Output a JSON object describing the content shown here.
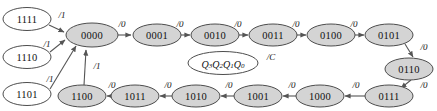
{
  "diagram": {
    "width": 437,
    "height": 111,
    "colors": {
      "state_fill": "#d4d4d4",
      "state_open_fill": "#ffffff",
      "stroke": "#4d4d4d",
      "edge": "#555555",
      "text": "#111111",
      "background": "#ffffff"
    },
    "legend": {
      "state_encoding": "Q3Q2Q1Q0",
      "q3": "Q",
      "q3_sub": "3",
      "q2": "Q",
      "q2_sub": "2",
      "q1": "Q",
      "q1_sub": "1",
      "q0": "Q",
      "q0_sub": "0",
      "output_label": "/C"
    },
    "states": [
      {
        "id": "s1111",
        "label": "1111",
        "cx": 27,
        "cy": 19,
        "rx": 24,
        "ry": 11.5,
        "filled": false
      },
      {
        "id": "s1110",
        "label": "1110",
        "cx": 27,
        "cy": 57,
        "rx": 24,
        "ry": 11.5,
        "filled": false
      },
      {
        "id": "s1101",
        "label": "1101",
        "cx": 27,
        "cy": 94,
        "rx": 24,
        "ry": 11.5,
        "filled": false
      },
      {
        "id": "s0000",
        "label": "0000",
        "cx": 92,
        "cy": 35,
        "rx": 26,
        "ry": 12,
        "filled": true
      },
      {
        "id": "s0001",
        "label": "0001",
        "cx": 157,
        "cy": 35,
        "rx": 24,
        "ry": 11,
        "filled": true
      },
      {
        "id": "s0010",
        "label": "0010",
        "cx": 215,
        "cy": 35,
        "rx": 24,
        "ry": 11,
        "filled": true
      },
      {
        "id": "s0011",
        "label": "0011",
        "cx": 273,
        "cy": 35,
        "rx": 24,
        "ry": 11,
        "filled": true
      },
      {
        "id": "s0100",
        "label": "0100",
        "cx": 331,
        "cy": 35,
        "rx": 24,
        "ry": 11,
        "filled": true
      },
      {
        "id": "s0101",
        "label": "0101",
        "cx": 389,
        "cy": 35,
        "rx": 24,
        "ry": 11,
        "filled": true
      },
      {
        "id": "s0110",
        "label": "0110",
        "cx": 409,
        "cy": 69,
        "rx": 24,
        "ry": 11,
        "filled": true
      },
      {
        "id": "s0111",
        "label": "0111",
        "cx": 389,
        "cy": 96,
        "rx": 24,
        "ry": 11,
        "filled": true
      },
      {
        "id": "s1000",
        "label": "1000",
        "cx": 320,
        "cy": 96,
        "rx": 24,
        "ry": 11,
        "filled": true
      },
      {
        "id": "s1001",
        "label": "1001",
        "cx": 258,
        "cy": 96,
        "rx": 24,
        "ry": 11,
        "filled": true
      },
      {
        "id": "s1010",
        "label": "1010",
        "cx": 196,
        "cy": 96,
        "rx": 24,
        "ry": 11,
        "filled": true
      },
      {
        "id": "s1011",
        "label": "1011",
        "cx": 135,
        "cy": 96,
        "rx": 24,
        "ry": 11,
        "filled": true
      },
      {
        "id": "s1100",
        "label": "1100",
        "cx": 82,
        "cy": 96,
        "rx": 24,
        "ry": 11,
        "filled": true
      }
    ],
    "transitions": [
      {
        "from": "1111",
        "to": "0000",
        "label": "/1",
        "lx": 62,
        "ly": 15
      },
      {
        "from": "1110",
        "to": "0000",
        "label": "/1",
        "lx": 47,
        "ly": 44
      },
      {
        "from": "1101",
        "to": "0000",
        "label": "/1",
        "lx": 50,
        "ly": 79
      },
      {
        "from": "0000",
        "to": "0001",
        "label": "/0",
        "lx": 114,
        "ly": 25
      },
      {
        "from": "0001",
        "to": "0010",
        "label": "/0",
        "lx": 172,
        "ly": 25
      },
      {
        "from": "0010",
        "to": "0011",
        "label": "/0",
        "lx": 230,
        "ly": 25
      },
      {
        "from": "0011",
        "to": "0100",
        "label": "/0",
        "lx": 288,
        "ly": 25
      },
      {
        "from": "0100",
        "to": "0101",
        "label": "/0",
        "lx": 346,
        "ly": 25
      },
      {
        "from": "0101",
        "to": "0110",
        "label": "/0",
        "lx": 421,
        "ly": 48
      },
      {
        "from": "0110",
        "to": "0111",
        "label": "/0",
        "lx": 421,
        "ly": 84
      },
      {
        "from": "0111",
        "to": "1000",
        "label": "/0",
        "lx": 355,
        "ly": 86
      },
      {
        "from": "1000",
        "to": "1001",
        "label": "/0",
        "lx": 291,
        "ly": 86
      },
      {
        "from": "1001",
        "to": "1010",
        "label": "/0",
        "lx": 228,
        "ly": 86
      },
      {
        "from": "1010",
        "to": "1011",
        "label": "/0",
        "lx": 167,
        "ly": 86
      },
      {
        "from": "1011",
        "to": "1100",
        "label": "/0",
        "lx": 110,
        "ly": 86
      },
      {
        "from": "1100",
        "to": "0000",
        "label": "/1",
        "lx": 96,
        "ly": 67
      }
    ]
  }
}
